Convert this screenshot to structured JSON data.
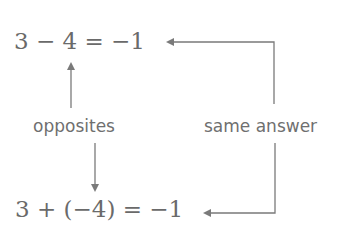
{
  "equations": {
    "top": "3 − 4 = −1",
    "bottom": "3 + (−4) = −1"
  },
  "labels": {
    "left": "opposites",
    "right": "same answer"
  },
  "arrows": [
    {
      "name": "opposites-up-arrow",
      "from": "opposites",
      "to": "4 in top equation",
      "direction": "up"
    },
    {
      "name": "opposites-down-arrow",
      "from": "opposites",
      "to": "−4 in bottom equation",
      "direction": "down"
    },
    {
      "name": "same-answer-top-arrow",
      "from": "same answer",
      "to": "−1 in top equation",
      "direction": "up-then-left"
    },
    {
      "name": "same-answer-bottom-arrow",
      "from": "same answer",
      "to": "−1 in bottom equation",
      "direction": "down-then-left"
    }
  ],
  "colors": {
    "text": "#6a6a6a",
    "arrow": "#7a7a7a",
    "background": "#ffffff"
  }
}
